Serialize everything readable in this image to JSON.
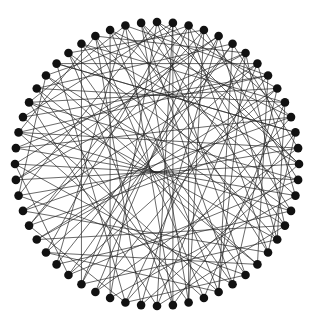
{
  "diagram": {
    "type": "circular-network-graph",
    "center": [
      157,
      164
    ],
    "radius": 142,
    "node_count": 56,
    "node_radius": 4.3,
    "node_color": "#111111",
    "edge_color": "#222222",
    "background": "#ffffff",
    "edges": [
      [
        0,
        14
      ],
      [
        0,
        22
      ],
      [
        0,
        31
      ],
      [
        0,
        40
      ],
      [
        1,
        17
      ],
      [
        1,
        27
      ],
      [
        1,
        36
      ],
      [
        1,
        45
      ],
      [
        2,
        11
      ],
      [
        2,
        20
      ],
      [
        2,
        33
      ],
      [
        2,
        48
      ],
      [
        3,
        15
      ],
      [
        3,
        26
      ],
      [
        3,
        38
      ],
      [
        3,
        50
      ],
      [
        4,
        19
      ],
      [
        4,
        29
      ],
      [
        4,
        42
      ],
      [
        5,
        13
      ],
      [
        5,
        24
      ],
      [
        5,
        35
      ],
      [
        5,
        47
      ],
      [
        6,
        18
      ],
      [
        6,
        30
      ],
      [
        6,
        41
      ],
      [
        6,
        52
      ],
      [
        7,
        16
      ],
      [
        7,
        28
      ],
      [
        7,
        39
      ],
      [
        7,
        49
      ],
      [
        8,
        21
      ],
      [
        8,
        32
      ],
      [
        8,
        44
      ],
      [
        8,
        54
      ],
      [
        9,
        23
      ],
      [
        9,
        34
      ],
      [
        9,
        46
      ],
      [
        10,
        25
      ],
      [
        10,
        37
      ],
      [
        10,
        51
      ],
      [
        11,
        30
      ],
      [
        11,
        43
      ],
      [
        11,
        53
      ],
      [
        12,
        27
      ],
      [
        12,
        38
      ],
      [
        12,
        49
      ],
      [
        13,
        32
      ],
      [
        13,
        44
      ],
      [
        14,
        29
      ],
      [
        14,
        41
      ],
      [
        14,
        55
      ],
      [
        15,
        34
      ],
      [
        15,
        46
      ],
      [
        16,
        31
      ],
      [
        16,
        43
      ],
      [
        17,
        35
      ],
      [
        17,
        50
      ],
      [
        18,
        37
      ],
      [
        18,
        48
      ],
      [
        19,
        33
      ],
      [
        19,
        52
      ],
      [
        20,
        39
      ],
      [
        20,
        54
      ],
      [
        21,
        36
      ],
      [
        21,
        47
      ],
      [
        22,
        40
      ],
      [
        22,
        51
      ],
      [
        23,
        42
      ],
      [
        23,
        55
      ],
      [
        24,
        45
      ],
      [
        24,
        53
      ],
      [
        25,
        44
      ],
      [
        26,
        47
      ],
      [
        26,
        55
      ],
      [
        27,
        50
      ],
      [
        28,
        46
      ],
      [
        28,
        1
      ],
      [
        29,
        52
      ],
      [
        30,
        49
      ],
      [
        31,
        53
      ],
      [
        32,
        3
      ],
      [
        33,
        51
      ],
      [
        34,
        5
      ],
      [
        35,
        54
      ],
      [
        36,
        7
      ],
      [
        37,
        9
      ],
      [
        38,
        2
      ],
      [
        39,
        11
      ],
      [
        40,
        13
      ],
      [
        41,
        4
      ],
      [
        42,
        15
      ],
      [
        43,
        6
      ],
      [
        44,
        17
      ],
      [
        45,
        8
      ],
      [
        46,
        19
      ],
      [
        47,
        10
      ],
      [
        48,
        21
      ],
      [
        49,
        12
      ],
      [
        50,
        23
      ],
      [
        51,
        14
      ],
      [
        52,
        25
      ],
      [
        53,
        16
      ],
      [
        54,
        27
      ],
      [
        55,
        18
      ],
      [
        0,
        9
      ],
      [
        2,
        26
      ],
      [
        4,
        33
      ],
      [
        6,
        24
      ],
      [
        10,
        19
      ],
      [
        12,
        20
      ],
      [
        18,
        28
      ],
      [
        22,
        30
      ],
      [
        24,
        36
      ],
      [
        30,
        38
      ],
      [
        34,
        42
      ],
      [
        40,
        48
      ],
      [
        44,
        52
      ],
      [
        46,
        54
      ]
    ]
  }
}
